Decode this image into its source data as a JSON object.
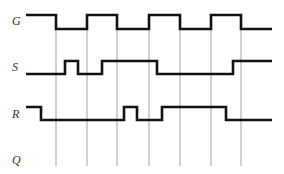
{
  "diagram": {
    "type": "timing",
    "colors": {
      "wave": "#111111",
      "guide": "#9a9a9a",
      "label": "#333333",
      "background": "#ffffff"
    },
    "guides": {
      "x": [
        56,
        87,
        117,
        149,
        180,
        211,
        241
      ],
      "y_top": 29,
      "y_bottom": 166
    },
    "signals": [
      {
        "name": "G",
        "label": "G",
        "label_y": 25,
        "high_y": 15,
        "low_y": 29,
        "start": 26,
        "end": 272,
        "initial": 1,
        "transitions": [
          56,
          87,
          117,
          149,
          180,
          211,
          241
        ]
      },
      {
        "name": "S",
        "label": "S",
        "label_y": 71,
        "high_y": 61,
        "low_y": 74,
        "start": 26,
        "end": 272,
        "initial": 0,
        "transitions": [
          65,
          78,
          102,
          157,
          233
        ]
      },
      {
        "name": "R",
        "label": "R",
        "label_y": 118,
        "high_y": 107,
        "low_y": 120,
        "start": 26,
        "end": 272,
        "initial": 1,
        "transitions": [
          41,
          124,
          137,
          162,
          226
        ]
      },
      {
        "name": "Q",
        "label": "Q",
        "label_y": 164,
        "high_y": null,
        "low_y": null,
        "start": null,
        "end": null,
        "initial": null,
        "transitions": []
      }
    ]
  }
}
